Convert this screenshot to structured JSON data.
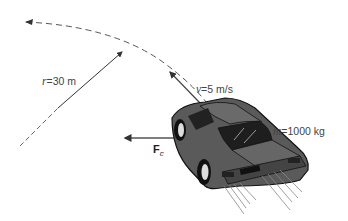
{
  "figure": {
    "labels": {
      "radius": {
        "symbol": "r",
        "equals": "=",
        "value": "30 m"
      },
      "velocity": {
        "symbol": "v",
        "equals": "=",
        "value": "5 m/s"
      },
      "mass": {
        "symbol": "m",
        "equals": "=",
        "value": "1000 kg"
      },
      "force": {
        "symbol": "F",
        "subscript": "c"
      }
    },
    "colors": {
      "line": "#333333",
      "car_body": "#5a5a5a",
      "car_dark": "#1e1e1e",
      "text": "#444444"
    }
  }
}
